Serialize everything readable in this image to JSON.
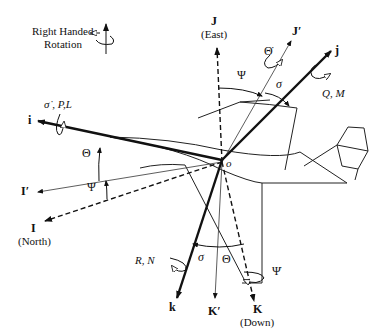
{
  "legend": {
    "line1": "Right Handed",
    "line2": "Rotation"
  },
  "axes": {
    "i": "i",
    "j": "j",
    "k": "k",
    "I": "I",
    "I_dir": "(North)",
    "J": "J",
    "J_dir": "(East)",
    "K": "K",
    "K_dir": "(Down)",
    "I_prime": "I′",
    "J_prime": "J′",
    "K_prime": "K′"
  },
  "origin": "o",
  "angles": {
    "psi_top": "Ψ",
    "sigma_top": "σ",
    "theta_left": "Θ",
    "psi_left": "Ψ",
    "sigma_bottom": "σ",
    "theta_bottom": "Θ"
  },
  "rates": {
    "roll": "σ̇ , P,L",
    "pitch": "Q, M",
    "yaw": "R, N",
    "theta_dot": "Θ̇",
    "psi_dot": "Ψ̇"
  }
}
